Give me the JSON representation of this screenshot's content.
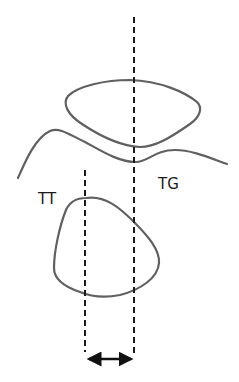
{
  "diagram": {
    "labels": {
      "tg": "TG",
      "tt": "TT"
    },
    "colors": {
      "outline": "#606060",
      "dashed_line": "#1a1a1a",
      "arrow": "#111111",
      "text": "#1a1a1a",
      "background": "#ffffff"
    },
    "elements": [
      {
        "id": "upper-contour",
        "kind": "closed-curve"
      },
      {
        "id": "wavy-line",
        "kind": "open-curve"
      },
      {
        "id": "tt-contour",
        "kind": "closed-curve"
      },
      {
        "id": "tg-reference-line",
        "kind": "dashed-vertical",
        "x": 134
      },
      {
        "id": "tt-reference-line",
        "kind": "dashed-vertical",
        "x": 85
      },
      {
        "id": "distance-arrow",
        "kind": "double-headed-arrow"
      }
    ]
  }
}
